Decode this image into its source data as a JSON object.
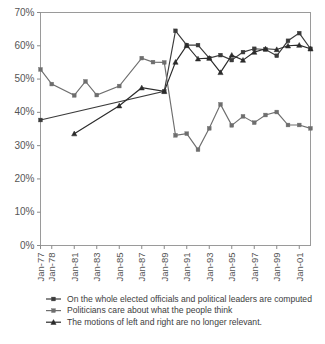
{
  "chart_data": {
    "type": "line",
    "title": "",
    "xlabel": "",
    "ylabel": "",
    "ylim": [
      0,
      70
    ],
    "y_unit": "%",
    "grid": false,
    "legend_position": "bottom",
    "y_ticks": [
      "0%",
      "10%",
      "20%",
      "30%",
      "40%",
      "50%",
      "60%",
      "70%"
    ],
    "y_tick_values": [
      0,
      10,
      20,
      30,
      40,
      50,
      60,
      70
    ],
    "x_tick_labels": [
      "Jan-77",
      "Jan-78",
      "Jan-81",
      "Jan-83",
      "Jan-85",
      "Jan-87",
      "Jan-89",
      "Jan-91",
      "Jan-93",
      "Jan-95",
      "Jan-97",
      "Jan-99",
      "Jan-01"
    ],
    "x_tick_positions": [
      0,
      1,
      3,
      5,
      7,
      9,
      11,
      13,
      15,
      17,
      19,
      21,
      23
    ],
    "x_index_count": 25,
    "series": [
      {
        "name": "On the  whole elected officials and political leaders are computed",
        "color": "#3b3b3b",
        "marker": "square",
        "x": [
          0,
          11,
          12,
          13,
          14,
          15,
          16,
          17,
          18,
          19,
          20,
          21,
          22,
          23,
          24
        ],
        "values": [
          37.7,
          46.3,
          64.5,
          60.2,
          60.2,
          56.3,
          57.2,
          55.7,
          58.1,
          59.1,
          58.9,
          57.0,
          61.5,
          63.8,
          59.1
        ]
      },
      {
        "name": "Politicians care about what the people think",
        "color": "#6e6e6e",
        "marker": "square",
        "x": [
          0,
          1,
          3,
          4,
          5,
          7,
          9,
          10,
          11,
          12,
          13,
          14,
          15,
          16,
          17,
          18,
          19,
          20,
          21,
          22,
          23,
          24
        ],
        "values": [
          52.9,
          48.5,
          45.1,
          49.3,
          45.2,
          47.9,
          56.3,
          55.1,
          55.0,
          33.1,
          33.6,
          28.8,
          35.2,
          42.4,
          36.1,
          38.8,
          36.9,
          39.2,
          40.1,
          36.2,
          36.2,
          35.2
        ]
      },
      {
        "name": "The motions of left and right are no longer relevant.",
        "color": "#2b2b2b",
        "marker": "triangle",
        "x": [
          3,
          7,
          9,
          11,
          12,
          13,
          14,
          15,
          16,
          17,
          18,
          19,
          20,
          21,
          22,
          23,
          24
        ],
        "values": [
          33.6,
          42.0,
          47.4,
          46.3,
          55.1,
          60.1,
          56.1,
          56.3,
          52.0,
          57.2,
          55.7,
          58.1,
          59.1,
          58.9,
          60.0,
          60.2,
          59.1
        ]
      }
    ]
  },
  "legend": {
    "items": [
      {
        "label": "On the  whole elected officials and political leaders are computed",
        "marker": "square"
      },
      {
        "label": "Politicians care about what the people think",
        "marker": "square"
      },
      {
        "label": "The motions of left and right are no longer relevant.",
        "marker": "triangle"
      }
    ]
  }
}
